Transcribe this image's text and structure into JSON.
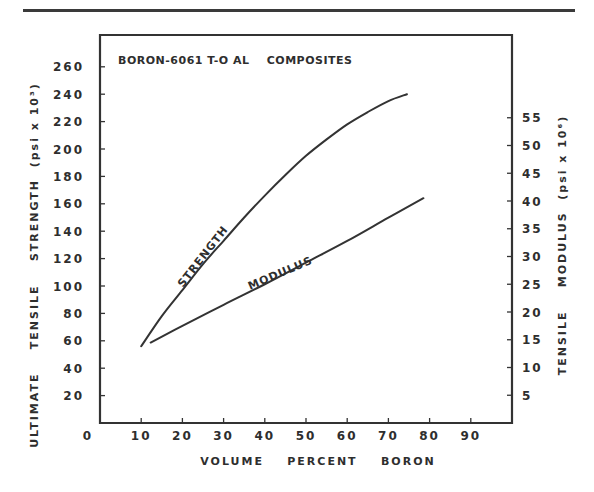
{
  "chart_data": {
    "type": "line",
    "title": "BORON-6061 T-O AL    COMPOSITES",
    "xlabel": "VOLUME    PERCENT    BORON",
    "ylabel_left": "ULTIMATE    TENSILE    STRENGTH  (psi x 10³)",
    "ylabel_right": "TENSILE    MODULUS  (psi x 10⁶)",
    "xlim": [
      0,
      100
    ],
    "ylim_left": [
      0,
      280
    ],
    "ylim_right": [
      0,
      70
    ],
    "x_ticks": [
      "10",
      "20",
      "30",
      "40",
      "50",
      "60",
      "70",
      "80",
      "90"
    ],
    "x_zero_label": "0",
    "y_left_ticks": [
      "20",
      "40",
      "60",
      "80",
      "100",
      "120",
      "140",
      "160",
      "180",
      "200",
      "220",
      "240",
      "260"
    ],
    "y_right_ticks": [
      "5",
      "10",
      "15",
      "20",
      "25",
      "30",
      "35",
      "40",
      "45",
      "50",
      "55"
    ],
    "grid": false,
    "legend": "inline labels on curves",
    "series": [
      {
        "name": "STRENGTH",
        "axis": "left",
        "units": "psi x 10^3",
        "x": [
          10,
          15,
          20,
          25,
          30,
          35,
          40,
          45,
          50,
          55,
          60,
          65,
          70,
          74.5
        ],
        "y": [
          56,
          78,
          97,
          116,
          133,
          150,
          166,
          181,
          195,
          207,
          218,
          227,
          235,
          240
        ]
      },
      {
        "name": "MODULUS",
        "axis": "right",
        "units": "psi x 10^6",
        "x": [
          12.3,
          20,
          30,
          40,
          50,
          60,
          70,
          78.5
        ],
        "y": [
          14.5,
          17.5,
          21.3,
          25.0,
          28.9,
          32.8,
          37.0,
          40.5
        ]
      }
    ]
  },
  "labels": {
    "strength_curve": "STRENGTH",
    "modulus_curve": "MODULUS"
  }
}
